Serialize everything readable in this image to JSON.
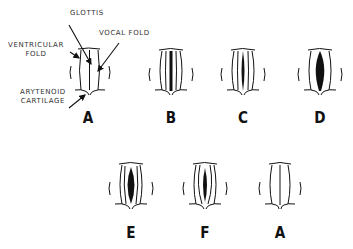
{
  "labels": {
    "glottis": "GLOTTIS",
    "vocal_fold": "VOCAL FOLD",
    "ventricular_fold": "VENTRICULAR\nFOLD",
    "ventricular_fold_line1": "VENTRICULAR",
    "ventricular_fold_line2": "FOLD",
    "arytenoid_line1": "ARYTENOID",
    "arytenoid_line2": "CARTILAGE"
  },
  "figures": [
    {
      "id": "A",
      "letter": "A",
      "glottis_width": 0,
      "row": 1
    },
    {
      "id": "B",
      "letter": "B",
      "glottis_width": 3,
      "row": 1
    },
    {
      "id": "C",
      "letter": "C",
      "glottis_width": 5,
      "row": 1
    },
    {
      "id": "D",
      "letter": "D",
      "glottis_width": 9,
      "row": 1
    },
    {
      "id": "E",
      "letter": "E",
      "glottis_width": 8,
      "row": 2
    },
    {
      "id": "F",
      "letter": "F",
      "glottis_width": 5,
      "row": 2
    },
    {
      "id": "A2",
      "letter": "A",
      "glottis_width": 0,
      "row": 2
    }
  ]
}
